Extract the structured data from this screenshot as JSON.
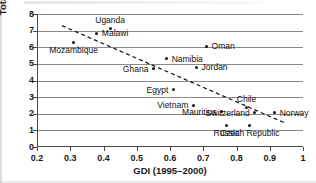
{
  "chart_data": {
    "type": "scatter",
    "title": "",
    "xlabel": "GDI (1995–2000)",
    "ylabel": "Total fertility rate",
    "xlim": [
      0.2,
      1.0
    ],
    "ylim": [
      0,
      8
    ],
    "xticks": [
      "0.2",
      "0.3",
      "0.4",
      "0.5",
      "0.6",
      "0.7",
      "0.8",
      "0.9",
      "1"
    ],
    "xtick_values": [
      0.2,
      0.3,
      0.4,
      0.5,
      0.6,
      0.7,
      0.8,
      0.9,
      1.0
    ],
    "yticks": [
      "0",
      "1",
      "2",
      "3",
      "4",
      "5",
      "6",
      "7",
      "8"
    ],
    "ytick_values": [
      0,
      1,
      2,
      3,
      4,
      5,
      6,
      7,
      8
    ],
    "grid": "horizontal",
    "legend": "none",
    "points": [
      {
        "label": "Mozambique",
        "x": 0.31,
        "y": 6.3,
        "label_pos": "below"
      },
      {
        "label": "Malawi",
        "x": 0.38,
        "y": 6.85,
        "label_pos": "right"
      },
      {
        "label": "Uganda",
        "x": 0.42,
        "y": 7.1,
        "label_pos": "above"
      },
      {
        "label": "Ghana",
        "x": 0.55,
        "y": 4.7,
        "label_pos": "left"
      },
      {
        "label": "Namibia",
        "x": 0.59,
        "y": 5.3,
        "label_pos": "right"
      },
      {
        "label": "Egypt",
        "x": 0.61,
        "y": 3.45,
        "label_pos": "left"
      },
      {
        "label": "Jordan",
        "x": 0.68,
        "y": 4.8,
        "label_pos": "right"
      },
      {
        "label": "Vietnam",
        "x": 0.67,
        "y": 2.5,
        "label_pos": "left"
      },
      {
        "label": "Oman",
        "x": 0.71,
        "y": 6.05,
        "label_pos": "right"
      },
      {
        "label": "Mauritius",
        "x": 0.755,
        "y": 2.12,
        "label_pos": "left"
      },
      {
        "label": "Russia",
        "x": 0.77,
        "y": 1.3,
        "label_pos": "below"
      },
      {
        "label": "Chile",
        "x": 0.83,
        "y": 2.35,
        "label_pos": "above"
      },
      {
        "label": "Czech Republic",
        "x": 0.84,
        "y": 1.3,
        "label_pos": "below"
      },
      {
        "label": "Switzerland",
        "x": 0.855,
        "y": 2.05,
        "label_pos": "left"
      },
      {
        "label": "Norway",
        "x": 0.915,
        "y": 2.05,
        "label_pos": "right"
      }
    ],
    "trendline": {
      "style": "dashed",
      "x_start": 0.275,
      "y_start": 7.3,
      "x_end": 0.945,
      "y_end": 1.45
    }
  }
}
